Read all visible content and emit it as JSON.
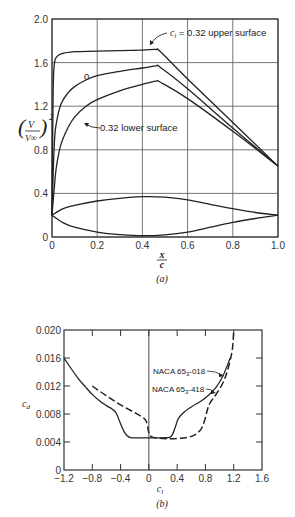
{
  "chart_data": [
    {
      "type": "line",
      "panel_label": "(a)",
      "title": "",
      "xlabel_num": "x",
      "xlabel_den": "c",
      "ylabel_num": "V",
      "ylabel_den": "V∞",
      "ylabel_exp": "2",
      "xlim": [
        0,
        1.0
      ],
      "ylim": [
        0,
        2.0
      ],
      "xticks": [
        0,
        0.2,
        0.4,
        0.6,
        0.8,
        1.0
      ],
      "xtick_labels": [
        "0",
        "0.2",
        "0.4",
        "0.6",
        "0.8",
        "1.0"
      ],
      "yticks": [
        0,
        0.4,
        0.8,
        1.2,
        1.6,
        2.0
      ],
      "ytick_labels": [
        "0",
        "0.4",
        "0.8",
        "1.2",
        "1.6",
        "2.0"
      ],
      "grid": true,
      "series": [
        {
          "name": "cl = 0.32 upper surface",
          "label_prefix": "c",
          "label_sub": "l",
          "label_rest": " = 0.32 upper surface",
          "style": "solid",
          "x": [
            0,
            0.005,
            0.01,
            0.02,
            0.04,
            0.1,
            0.2,
            0.3,
            0.4,
            0.46,
            0.48,
            0.6,
            0.8,
            1.0
          ],
          "y": [
            0.2,
            1.3,
            1.58,
            1.65,
            1.68,
            1.7,
            1.705,
            1.71,
            1.715,
            1.72,
            1.7,
            1.45,
            1.05,
            0.65
          ]
        },
        {
          "name": "cl = 0",
          "label": "0",
          "style": "solid",
          "x": [
            0,
            0.01,
            0.02,
            0.04,
            0.07,
            0.1,
            0.15,
            0.2,
            0.3,
            0.4,
            0.46,
            0.48,
            0.6,
            0.8,
            1.0
          ],
          "y": [
            0.2,
            0.85,
            1.05,
            1.22,
            1.32,
            1.38,
            1.44,
            1.48,
            1.52,
            1.55,
            1.57,
            1.555,
            1.36,
            1.0,
            0.65
          ]
        },
        {
          "name": "cl = 0.32 lower surface",
          "label": "0.32 lower surface",
          "style": "solid",
          "x": [
            0,
            0.01,
            0.02,
            0.04,
            0.07,
            0.1,
            0.15,
            0.2,
            0.3,
            0.4,
            0.46,
            0.48,
            0.6,
            0.8,
            1.0
          ],
          "y": [
            0.2,
            0.45,
            0.65,
            0.85,
            1.0,
            1.1,
            1.2,
            1.26,
            1.34,
            1.4,
            1.43,
            1.42,
            1.27,
            0.97,
            0.65
          ]
        },
        {
          "name": "airfoil profile upper",
          "style": "solid",
          "x": [
            0,
            0.05,
            0.1,
            0.2,
            0.3,
            0.4,
            0.5,
            0.6,
            0.7,
            0.8,
            0.9,
            1.0
          ],
          "y": [
            0.2,
            0.26,
            0.29,
            0.33,
            0.355,
            0.37,
            0.365,
            0.34,
            0.3,
            0.26,
            0.225,
            0.2
          ]
        },
        {
          "name": "airfoil profile lower",
          "style": "solid",
          "x": [
            0,
            0.05,
            0.1,
            0.2,
            0.3,
            0.4,
            0.5,
            0.6,
            0.7,
            0.8,
            0.9,
            1.0
          ],
          "y": [
            0.2,
            0.13,
            0.09,
            0.045,
            0.022,
            0.012,
            0.02,
            0.045,
            0.09,
            0.135,
            0.17,
            0.2
          ]
        }
      ]
    },
    {
      "type": "line",
      "panel_label": "(b)",
      "title": "",
      "xlabel": "c",
      "xlabel_sub": "l",
      "ylabel": "c",
      "ylabel_sub": "d",
      "xlim": [
        -1.2,
        1.6
      ],
      "ylim": [
        0,
        0.02
      ],
      "xticks": [
        -1.2,
        -0.8,
        -0.4,
        0,
        0.4,
        0.8,
        1.2,
        1.6
      ],
      "xtick_labels": [
        "−1.2",
        "−0.8",
        "−0.4",
        "0",
        "0.4",
        "0.8",
        "1.2",
        "1.6"
      ],
      "yticks": [
        0,
        0.004,
        0.008,
        0.012,
        0.016,
        0.02
      ],
      "ytick_labels": [
        "0",
        "0.004",
        "0.008",
        "0.012",
        "0.016",
        "0.020"
      ],
      "grid": false,
      "vertical_line_at": 0,
      "series": [
        {
          "name": "NACA 65₃-018",
          "label_base": "NACA 65",
          "label_sub": "3",
          "label_rest": "-018",
          "style": "solid",
          "x": [
            -1.2,
            -1.1,
            -1.0,
            -0.9,
            -0.8,
            -0.7,
            -0.6,
            -0.52,
            -0.46,
            -0.4,
            -0.34,
            -0.28,
            -0.2,
            0,
            0.2,
            0.3,
            0.34,
            0.38,
            0.42,
            0.5,
            0.6,
            0.8,
            0.95,
            1.05,
            1.15
          ],
          "y": [
            0.016,
            0.0145,
            0.0131,
            0.0119,
            0.0108,
            0.0099,
            0.0092,
            0.0087,
            0.0081,
            0.0066,
            0.0053,
            0.0047,
            0.0046,
            0.0046,
            0.0046,
            0.0047,
            0.0052,
            0.0063,
            0.0074,
            0.0083,
            0.009,
            0.0103,
            0.0118,
            0.0135,
            0.016
          ]
        },
        {
          "name": "NACA 65₃-418",
          "label_base": "NACA 65",
          "label_sub": "3",
          "label_rest": "-418",
          "style": "dashed",
          "x": [
            -0.8,
            -0.6,
            -0.4,
            -0.2,
            -0.1,
            -0.05,
            -0.02,
            0.0,
            0.05,
            0.2,
            0.4,
            0.6,
            0.72,
            0.78,
            0.82,
            0.86,
            0.95,
            1.05,
            1.12,
            1.18,
            1.2
          ],
          "y": [
            0.012,
            0.0106,
            0.0093,
            0.0082,
            0.0076,
            0.0072,
            0.0064,
            0.0053,
            0.0047,
            0.0045,
            0.0045,
            0.0048,
            0.0056,
            0.0068,
            0.0083,
            0.0095,
            0.0108,
            0.0125,
            0.0145,
            0.0172,
            0.02
          ]
        }
      ]
    }
  ]
}
